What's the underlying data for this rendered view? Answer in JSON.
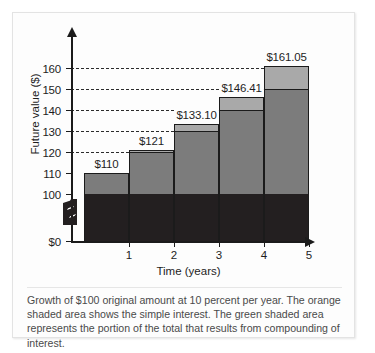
{
  "chart_data": {
    "type": "bar",
    "title": "",
    "subtitle": "",
    "xlabel": "Time (years)",
    "ylabel": "Future value ($)",
    "categories": [
      "1",
      "2",
      "3",
      "4",
      "5"
    ],
    "x": [
      1,
      2,
      3,
      4,
      5
    ],
    "ylim": [
      0,
      168
    ],
    "y_axis_break": true,
    "y_axis_break_between": [
      0,
      100
    ],
    "yticks": [
      0,
      100,
      110,
      120,
      130,
      140,
      150,
      160
    ],
    "ytick_labels": [
      "$0",
      "100",
      "110",
      "120",
      "130",
      "140",
      "150",
      "160"
    ],
    "grid": "horizontal-dashed",
    "gridline_values": [
      120,
      130,
      140,
      150,
      160
    ],
    "legend": "",
    "stacked": true,
    "series": [
      {
        "name": "Original amount (principal)",
        "color": "#231f20",
        "values": [
          100,
          100,
          100,
          100,
          100
        ]
      },
      {
        "name": "Simple interest",
        "color": "#7c7c7c",
        "values": [
          10,
          20,
          30,
          40,
          50
        ]
      },
      {
        "name": "Compounding of interest",
        "color": "#a9a9a9",
        "values": [
          0,
          1,
          3.1,
          6.41,
          11.05
        ]
      }
    ],
    "totals": [
      110,
      121,
      133.1,
      146.41,
      161.05
    ],
    "data_labels": [
      "$110",
      "$121",
      "$133.10",
      "$146.41",
      "$161.05"
    ],
    "annotations": []
  },
  "caption": {
    "text": "Growth of $100 original amount at 10 percent per year. The orange shaded area shows the simple interest. The green shaded area represents the portion of the total that results from compounding of interest."
  },
  "colors": {
    "principal": "#231f20",
    "simple_interest": "#7c7c7c",
    "compound_interest": "#a9a9a9",
    "axis": "#1b1b1b",
    "gridline": "#2b2b2b",
    "caption_text": "#4a4a4a",
    "figure_background": "#fdfdfd",
    "figure_border": "#e3e3e3"
  }
}
